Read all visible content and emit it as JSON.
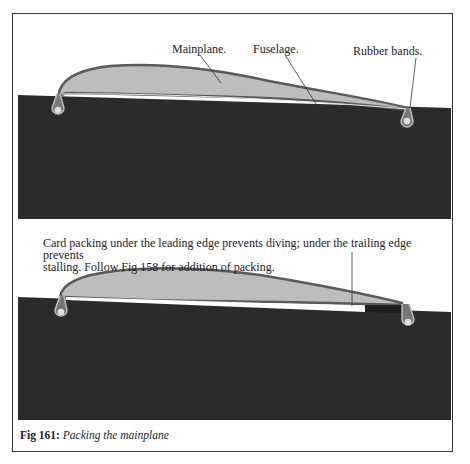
{
  "figure": {
    "number_label": "Fig 161:",
    "title": "Packing the mainplane"
  },
  "top_diagram": {
    "labels": {
      "mainplane": "Mainplane.",
      "fuselage": "Fuselage.",
      "rubber_bands": "Rubber bands."
    }
  },
  "bottom_diagram": {
    "note_line1": "Card packing under the leading edge prevents diving; under the trailing edge prevents",
    "note_line2": "stalling. Follow Fig 158 for addition of packing."
  },
  "colors": {
    "fuselage": "#2a2a2a",
    "wing_fill": "#bdbdbd",
    "wing_outline": "#5a5a5a",
    "peg": "#d8d8d8",
    "frame": "#333333"
  }
}
